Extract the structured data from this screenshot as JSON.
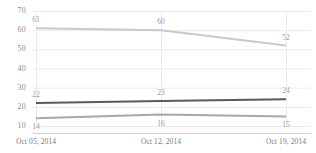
{
  "chart_data": {
    "type": "line",
    "title": "",
    "subtitle": "",
    "xlabel": "",
    "ylabel": "",
    "categories": [
      "Oct 05, 2014",
      "Oct 12, 2014",
      "Oct 19, 2014"
    ],
    "ylim": [
      10,
      70
    ],
    "yticks": [
      10,
      20,
      30,
      40,
      50,
      60,
      70
    ],
    "ytick_labels": [
      "10",
      "20",
      "30",
      "40",
      "50",
      "60",
      "70"
    ],
    "grid": true,
    "grid_horizontal": true,
    "grid_vertical": true,
    "legend": false,
    "legend_position": "none",
    "data_labels": true,
    "series": [
      {
        "name": "series-1",
        "color": "#c9c9c9",
        "values": [
          61,
          60,
          52
        ],
        "labels": [
          "61",
          "60",
          "52"
        ],
        "label_position": "above"
      },
      {
        "name": "series-2",
        "color": "#5a5a5a",
        "values": [
          22,
          23,
          24
        ],
        "labels": [
          "22",
          "23",
          "24"
        ],
        "label_position": "above"
      },
      {
        "name": "series-3",
        "color": "#a8a8a8",
        "values": [
          14,
          16,
          15
        ],
        "labels": [
          "14",
          "16",
          "15"
        ],
        "label_position": "below"
      }
    ],
    "colors": {
      "grid": "#ebebeb",
      "axis": "#d4d4d4",
      "tick_text": "#8c8c8c",
      "label_text": "#9a9a9a",
      "background": "#ffffff"
    }
  }
}
